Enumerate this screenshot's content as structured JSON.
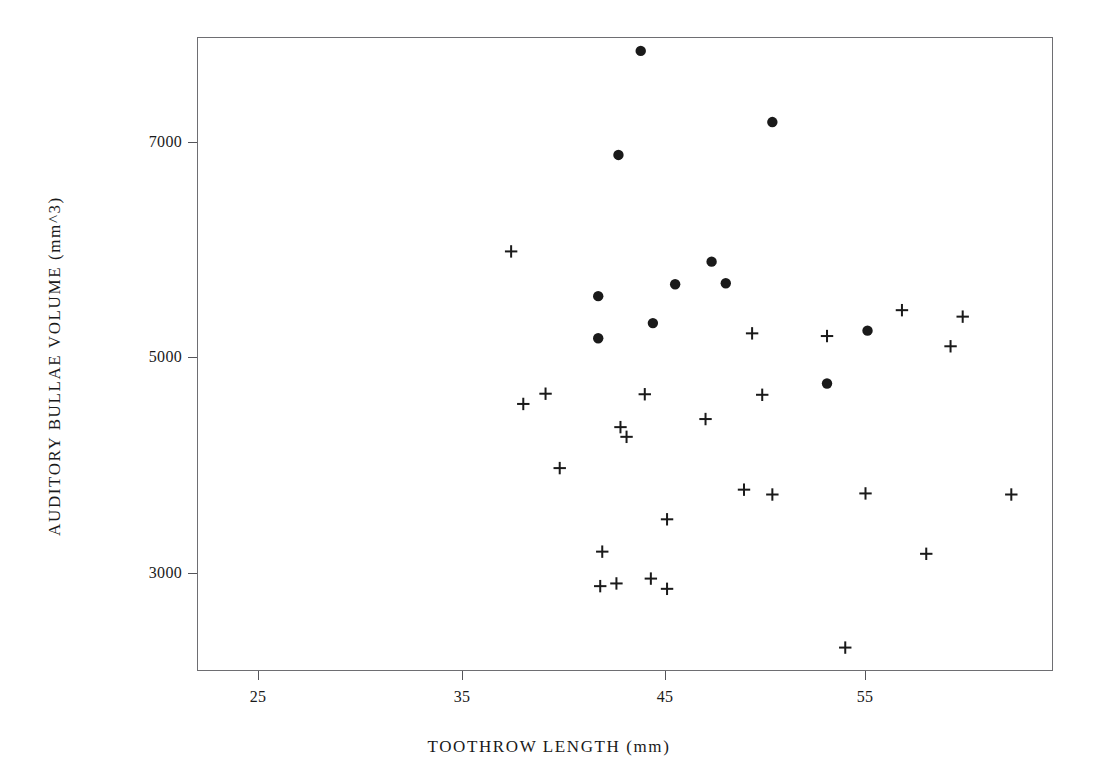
{
  "figure": {
    "background_color": "#ffffff",
    "ink_color": "#1a1a1a",
    "frame_color": "#6e6e72"
  },
  "axis": {
    "x_title": "TOOTHROW LENGTH (mm)",
    "y_title": "AUDITORY BULLAE VOLUME (mm^3)",
    "x_ticks": [
      "25",
      "35",
      "45",
      "55"
    ],
    "y_ticks": [
      "7000",
      "5000",
      "3000"
    ]
  },
  "chart_data": {
    "type": "scatter",
    "title": "",
    "xlabel": "TOOTHROW LENGTH (mm)",
    "ylabel": "AUDITORY BULLAE VOLUME (mm^3)",
    "xlim": [
      21.1,
      64.3
    ],
    "ylim": [
      2095,
      7880
    ],
    "xticks": [
      25,
      35,
      45,
      55
    ],
    "yticks": [
      3000,
      5000,
      7000
    ],
    "grid": false,
    "legend": null,
    "series": [
      {
        "name": "filled-circle-group",
        "marker": "filled-circle",
        "points": [
          {
            "x": 43.9,
            "y": 7845
          },
          {
            "x": 50.4,
            "y": 7185
          },
          {
            "x": 42.8,
            "y": 6880
          },
          {
            "x": 47.4,
            "y": 5890
          },
          {
            "x": 41.8,
            "y": 5570
          },
          {
            "x": 45.6,
            "y": 5680
          },
          {
            "x": 48.1,
            "y": 5690
          },
          {
            "x": 44.5,
            "y": 5320
          },
          {
            "x": 41.8,
            "y": 5180
          },
          {
            "x": 55.1,
            "y": 5250
          },
          {
            "x": 53.1,
            "y": 4760
          }
        ]
      },
      {
        "name": "plus-group",
        "marker": "plus",
        "points": [
          {
            "x": 37.5,
            "y": 5985
          },
          {
            "x": 56.8,
            "y": 5440
          },
          {
            "x": 59.8,
            "y": 5380
          },
          {
            "x": 53.1,
            "y": 5200
          },
          {
            "x": 49.4,
            "y": 5225
          },
          {
            "x": 59.2,
            "y": 5105
          },
          {
            "x": 39.2,
            "y": 4665
          },
          {
            "x": 38.1,
            "y": 4570
          },
          {
            "x": 44.1,
            "y": 4660
          },
          {
            "x": 49.9,
            "y": 4655
          },
          {
            "x": 47.1,
            "y": 4430
          },
          {
            "x": 42.9,
            "y": 4355
          },
          {
            "x": 43.2,
            "y": 4265
          },
          {
            "x": 39.9,
            "y": 3975
          },
          {
            "x": 49.0,
            "y": 3775
          },
          {
            "x": 50.4,
            "y": 3730
          },
          {
            "x": 45.2,
            "y": 3500
          },
          {
            "x": 55.0,
            "y": 3740
          },
          {
            "x": 62.2,
            "y": 3730
          },
          {
            "x": 42.0,
            "y": 3200
          },
          {
            "x": 41.9,
            "y": 2880
          },
          {
            "x": 42.7,
            "y": 2905
          },
          {
            "x": 44.4,
            "y": 2950
          },
          {
            "x": 45.2,
            "y": 2855
          },
          {
            "x": 58.0,
            "y": 3180
          },
          {
            "x": 54.0,
            "y": 2310
          }
        ]
      }
    ]
  },
  "pixel_geometry": {
    "frame": {
      "left": 197,
      "top": 37,
      "width": 856,
      "height": 634
    },
    "x_map": {
      "ref_value": 25,
      "ref_px": 258,
      "px_per_unit": 20.25
    },
    "y_map": {
      "ref_value": 7000,
      "ref_px": 142,
      "px_per_unit": 0.1078
    },
    "markers": {
      "filled_circle": [
        [
          641,
          51
        ],
        [
          772,
          122
        ],
        [
          599,
          155
        ],
        [
          692,
          262
        ],
        [
          677,
          289
        ],
        [
          752,
          288
        ],
        [
          603,
          300
        ],
        [
          652,
          328
        ],
        [
          599,
          338
        ],
        [
          868,
          334
        ],
        [
          827,
          387
        ]
      ],
      "plus": [
        [
          511,
          250
        ],
        [
          883,
          298
        ],
        [
          943,
          305
        ],
        [
          828,
          321
        ],
        [
          752,
          330
        ],
        [
          934,
          335
        ],
        [
          561,
          384
        ],
        [
          538,
          395
        ],
        [
          644,
          394
        ],
        [
          763,
          394
        ],
        [
          725,
          419
        ],
        [
          624,
          423
        ],
        [
          629,
          432
        ],
        [
          559,
          464
        ],
        [
          742,
          486
        ],
        [
          771,
          491
        ],
        [
          667,
          511
        ],
        [
          866,
          490
        ],
        [
          949,
          491
        ],
        [
          603,
          546
        ],
        [
          604,
          581
        ],
        [
          617,
          579
        ],
        [
          652,
          574
        ],
        [
          668,
          584
        ],
        [
          917,
          553
        ],
        [
          845,
          647
        ]
      ]
    }
  }
}
